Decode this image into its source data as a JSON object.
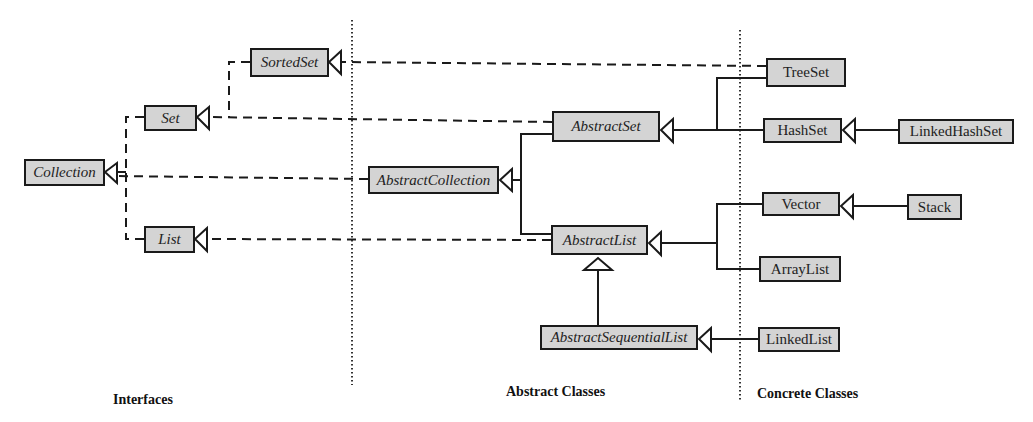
{
  "diagram": {
    "type": "class-hierarchy",
    "colors": {
      "box_fill": "#d4d4d4",
      "stroke": "#1a1a1a",
      "background": "#ffffff"
    },
    "sections": [
      {
        "id": "interfaces",
        "label": "Interfaces"
      },
      {
        "id": "abstract",
        "label": "Abstract Classes"
      },
      {
        "id": "concrete",
        "label": "Concrete Classes"
      }
    ],
    "nodes": {
      "collection": {
        "label": "Collection",
        "kind": "interface"
      },
      "set": {
        "label": "Set",
        "kind": "interface"
      },
      "sortedset": {
        "label": "SortedSet",
        "kind": "interface"
      },
      "list": {
        "label": "List",
        "kind": "interface"
      },
      "abstractcollection": {
        "label": "AbstractCollection",
        "kind": "abstract"
      },
      "abstractset": {
        "label": "AbstractSet",
        "kind": "abstract"
      },
      "abstractlist": {
        "label": "AbstractList",
        "kind": "abstract"
      },
      "abstractsequentiallist": {
        "label": "AbstractSequentialList",
        "kind": "abstract"
      },
      "treeset": {
        "label": "TreeSet",
        "kind": "concrete"
      },
      "hashset": {
        "label": "HashSet",
        "kind": "concrete"
      },
      "linkedhashset": {
        "label": "LinkedHashSet",
        "kind": "concrete"
      },
      "vector": {
        "label": "Vector",
        "kind": "concrete"
      },
      "stack": {
        "label": "Stack",
        "kind": "concrete"
      },
      "arraylist": {
        "label": "ArrayList",
        "kind": "concrete"
      },
      "linkedlist": {
        "label": "LinkedList",
        "kind": "concrete"
      }
    },
    "edges": [
      {
        "from": "Set",
        "to": "Collection",
        "style": "dashed",
        "relation": "extends"
      },
      {
        "from": "List",
        "to": "Collection",
        "style": "dashed",
        "relation": "extends"
      },
      {
        "from": "SortedSet",
        "to": "Set",
        "style": "dashed",
        "relation": "extends"
      },
      {
        "from": "AbstractCollection",
        "to": "Collection",
        "style": "dashed",
        "relation": "implements"
      },
      {
        "from": "AbstractSet",
        "to": "Set",
        "style": "dashed",
        "relation": "implements"
      },
      {
        "from": "AbstractList",
        "to": "List",
        "style": "dashed",
        "relation": "implements"
      },
      {
        "from": "TreeSet",
        "to": "SortedSet",
        "style": "dashed",
        "relation": "implements"
      },
      {
        "from": "AbstractSet",
        "to": "AbstractCollection",
        "style": "solid",
        "relation": "extends"
      },
      {
        "from": "AbstractList",
        "to": "AbstractCollection",
        "style": "solid",
        "relation": "extends"
      },
      {
        "from": "TreeSet",
        "to": "AbstractSet",
        "style": "solid",
        "relation": "extends"
      },
      {
        "from": "HashSet",
        "to": "AbstractSet",
        "style": "solid",
        "relation": "extends"
      },
      {
        "from": "LinkedHashSet",
        "to": "HashSet",
        "style": "solid",
        "relation": "extends"
      },
      {
        "from": "Vector",
        "to": "AbstractList",
        "style": "solid",
        "relation": "extends"
      },
      {
        "from": "ArrayList",
        "to": "AbstractList",
        "style": "solid",
        "relation": "extends"
      },
      {
        "from": "Stack",
        "to": "Vector",
        "style": "solid",
        "relation": "extends"
      },
      {
        "from": "AbstractSequentialList",
        "to": "AbstractList",
        "style": "solid",
        "relation": "extends"
      },
      {
        "from": "LinkedList",
        "to": "AbstractSequentialList",
        "style": "solid",
        "relation": "extends"
      }
    ]
  }
}
